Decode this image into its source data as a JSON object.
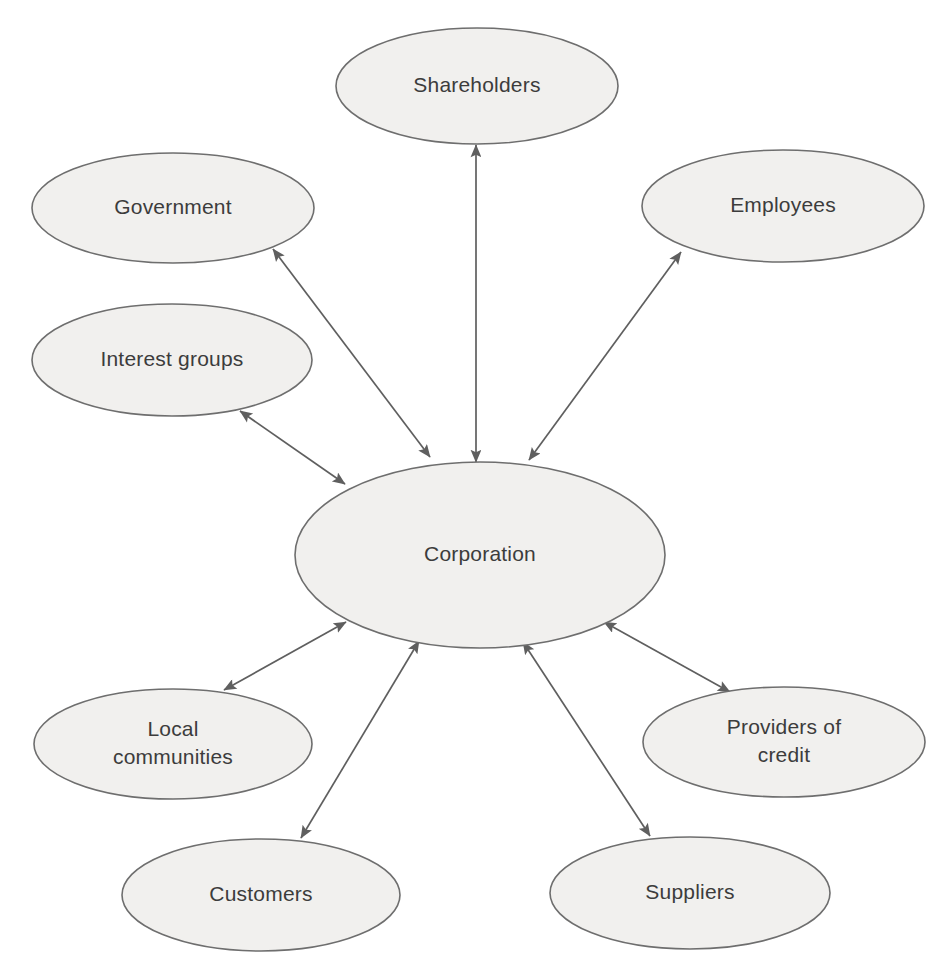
{
  "diagram": {
    "type": "hub-and-spoke network diagram",
    "background_color": "#ffffff",
    "node_fill_color": "#f1f0ee",
    "node_stroke_color": "#6e6e6e",
    "label_text_color": "#3c3c3c",
    "edge_color": "#5f5f5f",
    "center_node_id": "corporation",
    "nodes": [
      {
        "id": "corporation",
        "label": "Corporation",
        "lines": [
          "Corporation"
        ],
        "cx": 480,
        "cy": 555,
        "rx": 185,
        "ry": 93,
        "font_size": 22
      },
      {
        "id": "shareholders",
        "label": "Shareholders",
        "lines": [
          "Shareholders"
        ],
        "cx": 477,
        "cy": 86,
        "rx": 141,
        "ry": 58,
        "font_size": 21
      },
      {
        "id": "government",
        "label": "Government",
        "lines": [
          "Government"
        ],
        "cx": 173,
        "cy": 208,
        "rx": 141,
        "ry": 55,
        "font_size": 21
      },
      {
        "id": "employees",
        "label": "Employees",
        "lines": [
          "Employees"
        ],
        "cx": 783,
        "cy": 206,
        "rx": 141,
        "ry": 56,
        "font_size": 21
      },
      {
        "id": "interest-groups",
        "label": "Interest groups",
        "lines": [
          "Interest groups"
        ],
        "cx": 172,
        "cy": 360,
        "rx": 140,
        "ry": 56,
        "font_size": 21
      },
      {
        "id": "local-communities",
        "label": "Local communities",
        "lines": [
          "Local",
          "communities"
        ],
        "cx": 173,
        "cy": 744,
        "rx": 139,
        "ry": 55,
        "font_size": 21
      },
      {
        "id": "providers-of-credit",
        "label": "Providers of credit",
        "lines": [
          "Providers of",
          "credit"
        ],
        "cx": 784,
        "cy": 742,
        "rx": 141,
        "ry": 55,
        "font_size": 21
      },
      {
        "id": "customers",
        "label": "Customers",
        "lines": [
          "Customers"
        ],
        "cx": 261,
        "cy": 895,
        "rx": 139,
        "ry": 56,
        "font_size": 21
      },
      {
        "id": "suppliers",
        "label": "Suppliers",
        "lines": [
          "Suppliers"
        ],
        "cx": 690,
        "cy": 893,
        "rx": 140,
        "ry": 56,
        "font_size": 21
      }
    ],
    "edges": [
      {
        "id": "edge-shareholders-corporation",
        "from": "shareholders",
        "to": "corporation",
        "direction": "bidirectional",
        "x1": 476,
        "y1": 145,
        "x2": 476,
        "y2": 462
      },
      {
        "id": "edge-government-corporation",
        "from": "government",
        "to": "corporation",
        "direction": "bidirectional",
        "x1": 273,
        "y1": 249,
        "x2": 430,
        "y2": 457
      },
      {
        "id": "edge-employees-corporation",
        "from": "employees",
        "to": "corporation",
        "direction": "bidirectional",
        "x1": 681,
        "y1": 252,
        "x2": 529,
        "y2": 460
      },
      {
        "id": "edge-interest-groups-corporation",
        "from": "interest-groups",
        "to": "corporation",
        "direction": "bidirectional",
        "x1": 240,
        "y1": 411,
        "x2": 345,
        "y2": 484
      },
      {
        "id": "edge-local-communities-corporation",
        "from": "local-communities",
        "to": "corporation",
        "direction": "bidirectional",
        "x1": 224,
        "y1": 690,
        "x2": 346,
        "y2": 622
      },
      {
        "id": "edge-customers-corporation",
        "from": "customers",
        "to": "corporation",
        "direction": "bidirectional",
        "x1": 301,
        "y1": 838,
        "x2": 419,
        "y2": 641
      },
      {
        "id": "edge-suppliers-corporation",
        "from": "suppliers",
        "to": "corporation",
        "direction": "bidirectional",
        "x1": 650,
        "y1": 836,
        "x2": 523,
        "y2": 642
      },
      {
        "id": "edge-providers-of-credit-corporation",
        "from": "providers-of-credit",
        "to": "corporation",
        "direction": "bidirectional",
        "x1": 730,
        "y1": 692,
        "x2": 604,
        "y2": 622
      }
    ]
  }
}
